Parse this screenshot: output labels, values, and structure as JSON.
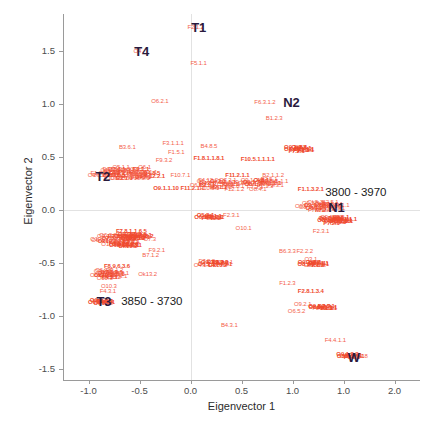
{
  "chart_data": {
    "type": "scatter",
    "title": "",
    "xlabel": "Eigenvector 1",
    "ylabel": "Eigenvector 2",
    "xlim": [
      -1.25,
      2.25
    ],
    "ylim": [
      -1.6,
      1.85
    ],
    "xticks": [
      "-1.0",
      "-0.5",
      "0.0",
      "0.5",
      "1.0",
      "1.0",
      "2.0"
    ],
    "xtick_values": [
      -1.0,
      -0.5,
      0.0,
      0.5,
      1.0,
      1.5,
      2.0
    ],
    "yticks": [
      "1.5",
      "1.0",
      "0.5",
      "0.0",
      "-0.5",
      "-1.0",
      "-1.5"
    ],
    "ytick_values": [
      1.5,
      1.0,
      0.5,
      0.0,
      -0.5,
      -1.0,
      -1.5
    ],
    "grid": false,
    "zero_gridlines": true,
    "point_color": "#f4604a",
    "dense_color": "#ef4a2e",
    "annotation_color": "#2a1a3d",
    "marker_style": "text-label",
    "points": [
      {
        "label": "F2.1.2",
        "x": 0.05,
        "y": 1.73
      },
      {
        "label": "F5.1.1",
        "x": 0.08,
        "y": 1.39
      },
      {
        "label": "O4",
        "x": -0.52,
        "y": 1.5
      },
      {
        "label": "O6.2.1",
        "x": -0.3,
        "y": 1.03
      },
      {
        "label": "F6.3.1.2",
        "x": 0.73,
        "y": 1.02
      },
      {
        "label": "B1.2.3",
        "x": 0.82,
        "y": 0.87
      },
      {
        "label": "B3.6.1",
        "x": -0.62,
        "y": 0.6
      },
      {
        "label": "F3.1.1.1",
        "x": -0.17,
        "y": 0.63
      },
      {
        "label": "B4.8.5",
        "x": 0.18,
        "y": 0.61
      },
      {
        "label": "F1.5.1",
        "x": -0.14,
        "y": 0.55
      },
      {
        "label": "F9.3.2",
        "x": -0.26,
        "y": 0.47
      },
      {
        "label": "F1.8.1.1.8.1",
        "x": 0.18,
        "y": 0.49
      },
      {
        "label": "F10.5.1.1.1.1",
        "x": 0.66,
        "y": 0.48
      },
      {
        "label": "O5.1.1",
        "x": -0.68,
        "y": 0.41
      },
      {
        "label": "O6.1",
        "x": -0.45,
        "y": 0.41
      },
      {
        "label": "O4",
        "x": -0.97,
        "y": 0.33
      },
      {
        "label": "F4.12.2.1",
        "x": -0.37,
        "y": 0.32
      },
      {
        "label": "F10.7.1",
        "x": -0.1,
        "y": 0.33
      },
      {
        "label": "F11.2.1.1",
        "x": 0.46,
        "y": 0.33
      },
      {
        "label": "B2.1.1.2",
        "x": 0.81,
        "y": 0.33
      },
      {
        "label": "O9.1.1.10",
        "x": -0.24,
        "y": 0.21
      },
      {
        "label": "F11.2.1.1",
        "x": 0.02,
        "y": 0.21
      },
      {
        "label": "F12.1.2",
        "x": 0.43,
        "y": 0.2
      },
      {
        "label": "O8.4.1",
        "x": 0.66,
        "y": 0.2
      },
      {
        "label": "O9.5.4.3",
        "x": 1.08,
        "y": 0.58
      },
      {
        "label": "F1.1.3.2.1",
        "x": 1.18,
        "y": 0.2
      },
      {
        "label": "Ok1.1.1",
        "x": 1.28,
        "y": 0.04
      },
      {
        "label": "O9.1.2.2",
        "x": 1.38,
        "y": -0.06
      },
      {
        "label": "O8.1.1.2.5",
        "x": 1.44,
        "y": -0.1
      },
      {
        "label": "F2.3.1",
        "x": 1.28,
        "y": -0.2
      },
      {
        "label": "F2.3.1",
        "x": 0.4,
        "y": -0.04
      },
      {
        "label": "F7.1.1.1",
        "x": 0.22,
        "y": -0.06
      },
      {
        "label": "O10.1",
        "x": 0.52,
        "y": -0.17
      },
      {
        "label": "F7.8.1.1.6.5",
        "x": -0.58,
        "y": -0.2
      },
      {
        "label": "O9.1.2.2.8.2",
        "x": -0.52,
        "y": -0.24
      },
      {
        "label": "Ok10.2",
        "x": -0.68,
        "y": -0.28
      },
      {
        "label": "O7.3",
        "x": -0.4,
        "y": -0.27
      },
      {
        "label": "F9.1.1.3",
        "x": -0.62,
        "y": -0.33
      },
      {
        "label": "F9.2.1",
        "x": -0.33,
        "y": -0.37
      },
      {
        "label": "B7.1.2",
        "x": -0.39,
        "y": -0.42
      },
      {
        "label": "F8.9.6.3.6",
        "x": -0.72,
        "y": -0.53
      },
      {
        "label": "O6.2.2",
        "x": -0.82,
        "y": -0.61
      },
      {
        "label": "Ok13.2",
        "x": -0.42,
        "y": -0.6
      },
      {
        "label": "O10.3",
        "x": -0.8,
        "y": -0.71
      },
      {
        "label": "F4.3.1",
        "x": -0.81,
        "y": -0.76
      },
      {
        "label": "F8.1.1",
        "x": -0.88,
        "y": -0.86
      },
      {
        "label": "F7.2.2",
        "x": 0.16,
        "y": -0.48
      },
      {
        "label": "O4.1.1.3",
        "x": 0.14,
        "y": -0.52
      },
      {
        "label": "Ok3.1",
        "x": 0.34,
        "y": -0.49
      },
      {
        "label": "B6.3.3",
        "x": 0.95,
        "y": -0.38
      },
      {
        "label": "F2.2.2",
        "x": 1.12,
        "y": -0.38
      },
      {
        "label": "O3.1",
        "x": 1.18,
        "y": -0.46
      },
      {
        "label": "O8.1.2.2",
        "x": 1.22,
        "y": -0.52
      },
      {
        "label": "F1.2.3",
        "x": 0.95,
        "y": -0.69
      },
      {
        "label": "F2.8.1.3.4",
        "x": 1.18,
        "y": -0.76
      },
      {
        "label": "O9.2.1",
        "x": 1.1,
        "y": -0.88
      },
      {
        "label": "F4.3.2.2",
        "x": 1.3,
        "y": -0.92
      },
      {
        "label": "O6.5.2",
        "x": 1.04,
        "y": -0.95
      },
      {
        "label": "B4.3.1",
        "x": 0.38,
        "y": -1.08
      },
      {
        "label": "F4.4.1.1",
        "x": 1.42,
        "y": -1.22
      },
      {
        "label": "O4",
        "x": 1.5,
        "y": -1.37
      },
      {
        "label": "F1.8",
        "x": 1.68,
        "y": -1.37
      }
    ],
    "cluster_annotations": [
      {
        "label": "T1",
        "x": 0.08,
        "y": 1.73
      },
      {
        "label": "T4",
        "x": -0.48,
        "y": 1.5
      },
      {
        "label": "N2",
        "x": 0.99,
        "y": 1.02
      },
      {
        "label": "N1",
        "x": 1.43,
        "y": 0.03
      },
      {
        "label": "T2",
        "x": -0.86,
        "y": 0.32
      },
      {
        "label": "T3",
        "x": -0.85,
        "y": -0.86
      },
      {
        "label": "W",
        "x": 1.6,
        "y": -1.38
      }
    ],
    "range_annotations": [
      {
        "label": "3800 - 3970",
        "x": 1.32,
        "y": 0.17
      },
      {
        "label": "3850 - 3730",
        "x": -0.68,
        "y": -0.86
      }
    ]
  }
}
